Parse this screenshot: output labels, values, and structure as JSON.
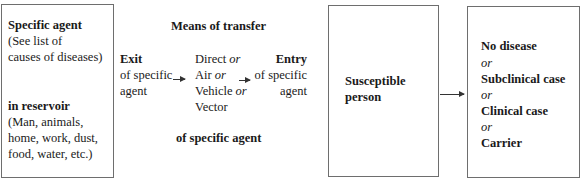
{
  "diagram": {
    "reservoir_box": {
      "title": "Specific agent",
      "title_note_1": "(See list of",
      "title_note_2": "causes of diseases)",
      "subtitle": "in reservoir",
      "note_1": "(Man, animals,",
      "note_2": "home, work, dust,",
      "note_3": "food, water, etc.)"
    },
    "transfer": {
      "heading": "Means of transfer",
      "footer": "of specific agent",
      "exit": {
        "title": "Exit",
        "line1": "of specific",
        "line2": "agent"
      },
      "means": [
        {
          "label": "Direct",
          "connector": "or"
        },
        {
          "label": "Air",
          "connector": "or"
        },
        {
          "label": "Vehicle",
          "connector": "or"
        },
        {
          "label": "Vector",
          "connector": ""
        }
      ],
      "entry": {
        "title": "Entry",
        "line1": "of specific",
        "line2": "agent"
      }
    },
    "host_box": {
      "line1": "Susceptible",
      "line2": "person"
    },
    "outcome_box": {
      "items": [
        {
          "label": "No disease"
        },
        {
          "connector": "or"
        },
        {
          "label": "Subclinical case"
        },
        {
          "connector": "or"
        },
        {
          "label": "Clinical case"
        },
        {
          "connector": "or"
        },
        {
          "label": "Carrier"
        }
      ]
    }
  }
}
